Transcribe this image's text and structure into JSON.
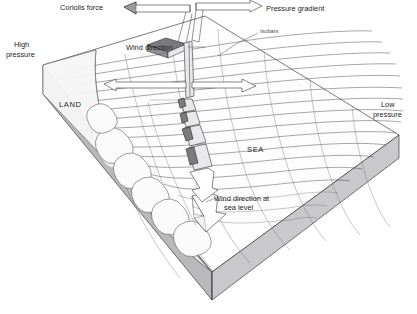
{
  "diagram": {
    "title_visible": false,
    "background_color": "#ffffff",
    "labels": {
      "coriolis_force": "Coriolis force",
      "pressure_gradient": "Pressure gradient",
      "isobars": "Isobars",
      "wind_direction": "Wind direction",
      "wind_direction_sea_level_line1": "Wind direction at",
      "wind_direction_sea_level_line2": "sea level",
      "high_pressure_line1": "High",
      "high_pressure_line2": "pressure",
      "low_pressure_line1": "Low",
      "low_pressure_line2": "pressure",
      "land": "LAND",
      "sea": "SEA"
    },
    "colors": {
      "ink": "#222226",
      "slab_side": "#b9b9bb",
      "slab_top": "#fdfdfd",
      "arrow_dark": "#7a7a80",
      "arrow_light": "#ffffff"
    },
    "elements": {
      "coriolis_arrow_direction": "left",
      "pressure_gradient_arrow_direction": "right",
      "wind_arrow_cross_left_direction": "left",
      "wind_arrow_cross_right_direction": "right",
      "surface_wind_arrow_direction": "down",
      "isobar_count": 14,
      "descending_arrow_count": 5
    }
  }
}
